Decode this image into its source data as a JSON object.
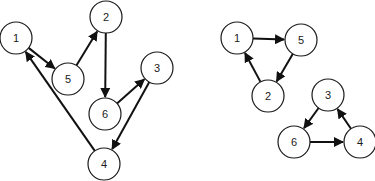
{
  "diagram": {
    "graphs": [
      {
        "id": "left",
        "description": "Directed graph with single 6-node cycle",
        "nodes": [
          {
            "id": "1",
            "label": "1"
          },
          {
            "id": "2",
            "label": "2"
          },
          {
            "id": "3",
            "label": "3"
          },
          {
            "id": "4",
            "label": "4"
          },
          {
            "id": "5",
            "label": "5"
          },
          {
            "id": "6",
            "label": "6"
          }
        ],
        "edges": [
          {
            "from": "1",
            "to": "5"
          },
          {
            "from": "5",
            "to": "2"
          },
          {
            "from": "2",
            "to": "6"
          },
          {
            "from": "6",
            "to": "3"
          },
          {
            "from": "3",
            "to": "4"
          },
          {
            "from": "4",
            "to": "1"
          }
        ]
      },
      {
        "id": "right",
        "description": "Two directed 3-cycles",
        "nodes": [
          {
            "id": "1",
            "label": "1"
          },
          {
            "id": "5",
            "label": "5"
          },
          {
            "id": "2",
            "label": "2"
          },
          {
            "id": "3",
            "label": "3"
          },
          {
            "id": "6",
            "label": "6"
          },
          {
            "id": "4",
            "label": "4"
          }
        ],
        "edges": [
          {
            "from": "1",
            "to": "5"
          },
          {
            "from": "5",
            "to": "2"
          },
          {
            "from": "2",
            "to": "1"
          },
          {
            "from": "3",
            "to": "6"
          },
          {
            "from": "6",
            "to": "4"
          },
          {
            "from": "4",
            "to": "3"
          }
        ]
      }
    ],
    "colors": {
      "stroke": "#111111",
      "node_fill": "#ffffff",
      "background": "#ffffff"
    }
  }
}
